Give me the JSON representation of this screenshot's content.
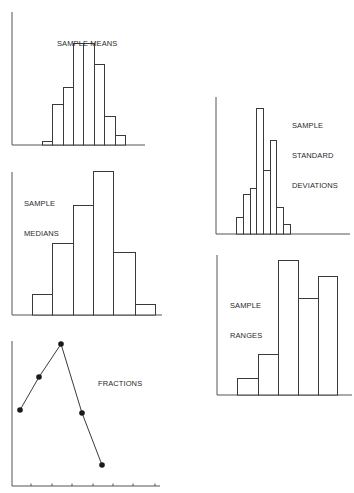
{
  "chart_data": [
    {
      "id": "means",
      "type": "bar",
      "title": "SAMPLE MEANS",
      "title_lines": [
        "SAMPLE MEANS"
      ],
      "xlabel": "",
      "ylabel": "",
      "grid": false,
      "bin_edges": [
        42,
        52,
        63,
        73,
        83,
        94,
        104,
        115,
        125
      ],
      "values": [
        4,
        41,
        58,
        102,
        102,
        81,
        29,
        10
      ],
      "ylim": [
        0,
        133
      ],
      "frame": {
        "axis_x": 12,
        "base_y": 145,
        "top_y": 12,
        "right_x": 145
      },
      "label_pos": {
        "x": 57,
        "y": 19
      }
    },
    {
      "id": "medians",
      "type": "bar",
      "title": "SAMPLE MEDIANS",
      "title_lines": [
        "SAMPLE",
        "MEDIANS"
      ],
      "xlabel": "",
      "ylabel": "",
      "grid": false,
      "bin_edges": [
        32,
        52,
        73,
        93,
        113,
        135,
        155
      ],
      "values": [
        21,
        72,
        110,
        144,
        63,
        11
      ],
      "ylim": [
        0,
        143
      ],
      "frame": {
        "axis_x": 12,
        "base_y": 315,
        "top_y": 172,
        "right_x": 162
      },
      "label_pos": {
        "x": 24,
        "y": 179
      }
    },
    {
      "id": "fractions",
      "type": "line",
      "title": "FRACTIONS",
      "title_lines": [
        "FRACTIONS"
      ],
      "xlabel": "",
      "ylabel": "",
      "grid": false,
      "x": [
        20,
        39,
        61,
        82,
        102
      ],
      "values": [
        76,
        109,
        142,
        73,
        21
      ],
      "ylim": [
        0,
        145
      ],
      "x_ticks": [
        31,
        52,
        72,
        93,
        113,
        133,
        155
      ],
      "frame": {
        "axis_x": 12,
        "base_y": 486,
        "top_y": 341,
        "right_x": 160
      },
      "label_pos": {
        "x": 98,
        "y": 359
      }
    },
    {
      "id": "std_devs",
      "type": "bar",
      "title": "SAMPLE STANDARD DEVIATIONS",
      "title_lines": [
        "SAMPLE",
        "STANDARD",
        "DEVIATIONS"
      ],
      "xlabel": "",
      "ylabel": "",
      "grid": false,
      "bin_edges": [
        236,
        243,
        250,
        256,
        263,
        270,
        276,
        283,
        290
      ],
      "values": [
        17,
        40,
        46,
        126,
        64,
        94,
        27,
        10
      ],
      "ylim": [
        0,
        137
      ],
      "frame": {
        "axis_x": 216,
        "base_y": 234,
        "top_y": 97,
        "right_x": 350
      },
      "label_pos": {
        "x": 292,
        "y": 101
      }
    },
    {
      "id": "ranges",
      "type": "bar",
      "title": "SAMPLE RANGES",
      "title_lines": [
        "SAMPLE",
        "RANGES"
      ],
      "xlabel": "",
      "ylabel": "",
      "grid": false,
      "bin_edges": [
        237,
        258,
        278,
        298,
        318,
        337
      ],
      "values": [
        17,
        41,
        135,
        97,
        119
      ],
      "ylim": [
        0,
        140
      ],
      "frame": {
        "axis_x": 217,
        "base_y": 395,
        "top_y": 255,
        "right_x": 352
      },
      "label_pos": {
        "x": 230,
        "y": 281
      }
    }
  ],
  "style": {
    "line_color": "#3a3a3a",
    "axis_color": "#555555",
    "bar_fill": "#ffffff",
    "marker_color": "#1a1a1a"
  }
}
